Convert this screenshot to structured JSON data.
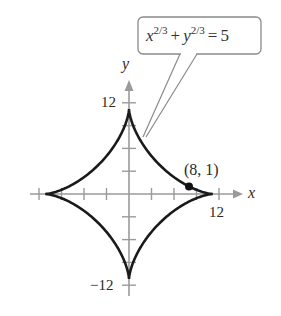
{
  "chart_data": {
    "type": "line",
    "title": "",
    "equation": {
      "lhs_x_base": "x",
      "lhs_x_exp": "2/3",
      "plus": "+",
      "lhs_y_base": "y",
      "lhs_y_exp": "2/3",
      "equals": "=",
      "rhs": "5"
    },
    "series": [
      {
        "name": "x^(2/3) + y^(2/3) = 5",
        "curve": "astroid",
        "radius": 11.18,
        "cusps": [
          [
            11.18,
            0
          ],
          [
            0,
            11.18
          ],
          [
            -11.18,
            0
          ],
          [
            0,
            -11.18
          ]
        ]
      }
    ],
    "highlighted_point": {
      "x": 8,
      "y": 1,
      "label": "(8, 1)"
    },
    "xlabel": "x",
    "ylabel": "y",
    "xlim": [
      -12,
      12
    ],
    "ylim": [
      -12,
      12
    ],
    "tick_step": 3,
    "labeled_ticks": {
      "x": [
        "12"
      ],
      "y": [
        "12",
        "−12"
      ]
    },
    "grid": false,
    "colors": {
      "curve": "#1a1a1a",
      "axis": "#9a9a9a",
      "callout_border": "#8a8a8a"
    }
  }
}
